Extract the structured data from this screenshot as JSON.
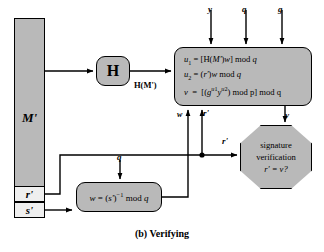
{
  "diagram": {
    "caption": "(b) Verifying",
    "message_block": {
      "label": "M'"
    },
    "signature_parts": [
      {
        "name": "r-prime",
        "label": "r'"
      },
      {
        "name": "s-prime",
        "label": "s'"
      }
    ],
    "hash_box": {
      "label": "H",
      "output_label": "H(M')"
    },
    "compute_box": {
      "lines": [
        "u1 = [H(M')w] mod q",
        "u2 = (r')w mod q",
        "v = [(g^u1 y^u2) mod p] mod q"
      ]
    },
    "w_box": {
      "text": "w = (s')^-1 mod q"
    },
    "verification_box": {
      "line1": "signature",
      "line2": "verification",
      "line3": "r' = v?"
    },
    "edge_labels": {
      "y": "y",
      "q_top": "q",
      "g": "g",
      "w": "w",
      "r_prime_up": "r'",
      "v": "v",
      "r_prime_to_oct": "r'",
      "q_into_w": "q"
    }
  },
  "colors": {
    "node_fill": "#b9b9b9",
    "sig_part_fill": "#efefef",
    "stroke": "#000000",
    "background": "#ffffff"
  }
}
